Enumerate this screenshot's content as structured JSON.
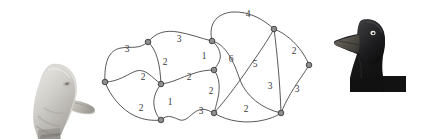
{
  "figure": {
    "title": "",
    "background_color": "#ffffff",
    "node_fill": "#8e8e8e",
    "node_stroke": "#2d2d2d",
    "edge_color": "#3b3b3b",
    "label_color": "#3a3a3a"
  },
  "images": {
    "left": {
      "name": "light-duck-head-photo",
      "description": "light grey duck head facing right",
      "x": 22,
      "y": 56,
      "w": 78,
      "h": 83
    },
    "right": {
      "name": "dark-duck-head-photo",
      "description": "dark duck head and neck facing left",
      "x": 328,
      "y": 8,
      "w": 86,
      "h": 84
    }
  },
  "chart_data": {
    "type": "diagram",
    "graph_type": "weighted-undirected-graph",
    "title": "",
    "nodes": [
      {
        "id": "n0",
        "x": 105,
        "y": 82
      },
      {
        "id": "n1",
        "x": 148,
        "y": 42
      },
      {
        "id": "n2",
        "x": 161,
        "y": 84
      },
      {
        "id": "n3",
        "x": 161,
        "y": 120
      },
      {
        "id": "n4",
        "x": 212,
        "y": 41
      },
      {
        "id": "n5",
        "x": 214,
        "y": 70
      },
      {
        "id": "n6",
        "x": 214,
        "y": 113
      },
      {
        "id": "n7",
        "x": 274,
        "y": 29
      },
      {
        "id": "n8",
        "x": 281,
        "y": 113
      },
      {
        "id": "n9",
        "x": 309,
        "y": 65
      }
    ],
    "edges": [
      {
        "source": "n0",
        "target": "n1",
        "weight": 3,
        "label_x": 127,
        "label_y": 50
      },
      {
        "source": "n0",
        "target": "n2",
        "weight": 2,
        "label_x": 143,
        "label_y": 78
      },
      {
        "source": "n0",
        "target": "n3",
        "weight": 2,
        "label_x": 141,
        "label_y": 109
      },
      {
        "source": "n1",
        "target": "n2",
        "weight": 2,
        "label_x": 165,
        "label_y": 63
      },
      {
        "source": "n1",
        "target": "n4",
        "weight": 3,
        "label_x": 179,
        "label_y": 40
      },
      {
        "source": "n2",
        "target": "n3",
        "weight": 1,
        "label_x": 170,
        "label_y": 103
      },
      {
        "source": "n2",
        "target": "n5",
        "weight": 2,
        "label_x": 189,
        "label_y": 78
      },
      {
        "source": "n3",
        "target": "n6",
        "weight": 3,
        "label_x": 201,
        "label_y": 112
      },
      {
        "source": "n4",
        "target": "n5",
        "weight": 1,
        "label_x": 204,
        "label_y": 57
      },
      {
        "source": "n4",
        "target": "n7",
        "weight": 4,
        "label_x": 248,
        "label_y": 15
      },
      {
        "source": "n4",
        "target": "n8",
        "weight": 6,
        "label_x": 231,
        "label_y": 60
      },
      {
        "source": "n5",
        "target": "n6",
        "weight": 2,
        "label_x": 211,
        "label_y": 92
      },
      {
        "source": "n6",
        "target": "n7",
        "weight": 5,
        "label_x": 255,
        "label_y": 65
      },
      {
        "source": "n6",
        "target": "n8",
        "weight": 2,
        "label_x": 246,
        "label_y": 110
      },
      {
        "source": "n7",
        "target": "n8",
        "weight": 3,
        "label_x": 270,
        "label_y": 87
      },
      {
        "source": "n7",
        "target": "n9",
        "weight": 2,
        "label_x": 294,
        "label_y": 52
      },
      {
        "source": "n8",
        "target": "n9",
        "weight": 3,
        "label_x": 297,
        "label_y": 90
      }
    ],
    "weights": [
      3,
      2,
      2,
      2,
      3,
      1,
      2,
      3,
      1,
      4,
      6,
      2,
      5,
      2,
      3,
      2,
      3
    ]
  }
}
